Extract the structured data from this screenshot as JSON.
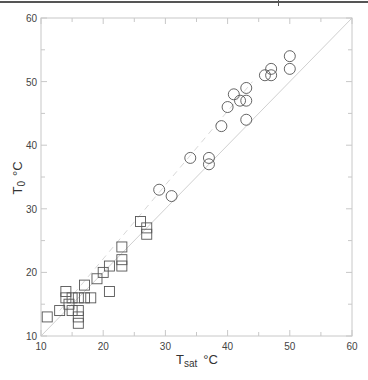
{
  "chart_data": {
    "type": "scatter",
    "title": "",
    "xlabel": "Tsat °C",
    "xlabel_main": "T",
    "xlabel_sub": "sat",
    "xlabel_unit": "°C",
    "ylabel": "T0 °C",
    "ylabel_main": "T",
    "ylabel_sub": "0",
    "ylabel_unit": "°C",
    "xlim": [
      10,
      60
    ],
    "ylim": [
      10,
      60
    ],
    "xticks": [
      10,
      20,
      30,
      40,
      50,
      60
    ],
    "yticks": [
      10,
      20,
      30,
      40,
      50,
      60
    ],
    "minor_tick_step": 5,
    "grid": false,
    "legend": null,
    "reference_lines": [
      {
        "name": "y=x",
        "style": "solid",
        "color": "#d0d0d0",
        "from": [
          10,
          10
        ],
        "to": [
          60,
          60
        ]
      },
      {
        "name": "fit",
        "style": "dashed",
        "color": "#d8d8d8",
        "from": [
          13,
          14
        ],
        "to": [
          44,
          50
        ]
      }
    ],
    "series": [
      {
        "name": "squares",
        "marker": "square",
        "points": [
          [
            11,
            13
          ],
          [
            13,
            14
          ],
          [
            15,
            14
          ],
          [
            16,
            14
          ],
          [
            16,
            13
          ],
          [
            16,
            12
          ],
          [
            14.5,
            15
          ],
          [
            14,
            16
          ],
          [
            15,
            16
          ],
          [
            16,
            16
          ],
          [
            17,
            16
          ],
          [
            18,
            16
          ],
          [
            14,
            17
          ],
          [
            17,
            18
          ],
          [
            19,
            19
          ],
          [
            20,
            20
          ],
          [
            21,
            21
          ],
          [
            21,
            17
          ],
          [
            23,
            21
          ],
          [
            23,
            22
          ],
          [
            23,
            24
          ],
          [
            26,
            28
          ],
          [
            27,
            27
          ],
          [
            27,
            26
          ]
        ]
      },
      {
        "name": "circles",
        "marker": "circle",
        "points": [
          [
            29,
            33
          ],
          [
            31,
            32
          ],
          [
            34,
            38
          ],
          [
            37,
            38
          ],
          [
            37,
            37
          ],
          [
            39,
            43
          ],
          [
            40,
            46
          ],
          [
            41,
            48
          ],
          [
            42,
            47
          ],
          [
            43,
            47
          ],
          [
            43,
            49
          ],
          [
            43,
            44
          ],
          [
            46,
            51
          ],
          [
            47,
            51
          ],
          [
            47,
            52
          ],
          [
            50,
            52
          ],
          [
            50,
            54
          ]
        ]
      }
    ]
  }
}
